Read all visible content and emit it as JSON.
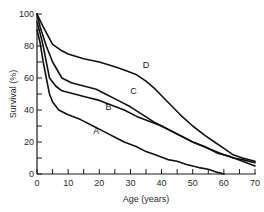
{
  "chart_data": {
    "type": "line",
    "title": "",
    "xlabel": "Age (years)",
    "ylabel": "Survival (%)",
    "xlim": [
      0,
      70
    ],
    "ylim": [
      0,
      100
    ],
    "x_ticks": [
      0,
      10,
      20,
      30,
      40,
      50,
      60,
      70
    ],
    "x_minor_ticks": [
      5,
      15,
      25,
      35,
      45,
      55,
      65
    ],
    "y_ticks": [
      0,
      20,
      40,
      60,
      80,
      100
    ],
    "y_minor_ticks": [
      10,
      30,
      50,
      70,
      90
    ],
    "grid": false,
    "legend": "inline labels on curves",
    "series": [
      {
        "name": "D",
        "label_pos": [
          35,
          66
        ],
        "points": [
          [
            0,
            100
          ],
          [
            2,
            92
          ],
          [
            5,
            81
          ],
          [
            8,
            77
          ],
          [
            10,
            75
          ],
          [
            15,
            72
          ],
          [
            20,
            70
          ],
          [
            25,
            67
          ],
          [
            28,
            65
          ],
          [
            32,
            62
          ],
          [
            35,
            58
          ],
          [
            38,
            53
          ],
          [
            42,
            45
          ],
          [
            46,
            37
          ],
          [
            50,
            30
          ],
          [
            54,
            24
          ],
          [
            57,
            20
          ],
          [
            60,
            16
          ],
          [
            63,
            12
          ],
          [
            66,
            10
          ],
          [
            70,
            8
          ]
        ]
      },
      {
        "name": "C",
        "label_pos": [
          31,
          50
        ],
        "points": [
          [
            0,
            100
          ],
          [
            1,
            92
          ],
          [
            3,
            80
          ],
          [
            5,
            70
          ],
          [
            8,
            60
          ],
          [
            11,
            57
          ],
          [
            15,
            55
          ],
          [
            19,
            53
          ],
          [
            22,
            50
          ],
          [
            26,
            46
          ],
          [
            30,
            42
          ],
          [
            34,
            37
          ],
          [
            38,
            32
          ],
          [
            42,
            28
          ],
          [
            46,
            24
          ],
          [
            50,
            20
          ],
          [
            55,
            16
          ],
          [
            60,
            12
          ],
          [
            63,
            10
          ],
          [
            66,
            9
          ],
          [
            70,
            7
          ]
        ]
      },
      {
        "name": "B",
        "label_pos": [
          23,
          40
        ],
        "points": [
          [
            0,
            95
          ],
          [
            1,
            88
          ],
          [
            2,
            80
          ],
          [
            3,
            70
          ],
          [
            4,
            60
          ],
          [
            6,
            55
          ],
          [
            8,
            52
          ],
          [
            12,
            50
          ],
          [
            16,
            48
          ],
          [
            20,
            46
          ],
          [
            24,
            43
          ],
          [
            28,
            40
          ],
          [
            32,
            36
          ],
          [
            36,
            33
          ],
          [
            40,
            30
          ],
          [
            45,
            25
          ],
          [
            50,
            20
          ],
          [
            54,
            17
          ],
          [
            58,
            13
          ],
          [
            62,
            11
          ],
          [
            66,
            8
          ],
          [
            70,
            5
          ]
        ]
      },
      {
        "name": "A",
        "label_pos": [
          19,
          25
        ],
        "points": [
          [
            0,
            90
          ],
          [
            1,
            82
          ],
          [
            2,
            70
          ],
          [
            3,
            60
          ],
          [
            4,
            50
          ],
          [
            5,
            45
          ],
          [
            7,
            40
          ],
          [
            10,
            37
          ],
          [
            14,
            34
          ],
          [
            18,
            30
          ],
          [
            22,
            26
          ],
          [
            25,
            23
          ],
          [
            28,
            20
          ],
          [
            32,
            17
          ],
          [
            35,
            14
          ],
          [
            38,
            12
          ],
          [
            42,
            9
          ],
          [
            45,
            8
          ],
          [
            48,
            6
          ],
          [
            52,
            4
          ],
          [
            55,
            3
          ],
          [
            58,
            1
          ],
          [
            60,
            0
          ]
        ]
      }
    ]
  }
}
